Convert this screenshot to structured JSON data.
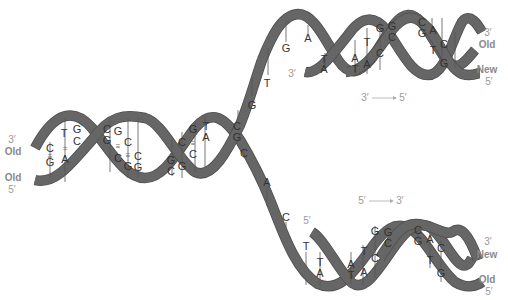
{
  "diagram": {
    "title_partial": "DNA replication fork",
    "colors": {
      "strand": "#666666",
      "label": "#9a9a9a",
      "base_text": "#333333"
    },
    "parent_helix": {
      "left_labels": {
        "top_end": "3′",
        "top_strand": "Old",
        "bottom_strand": "Old",
        "bottom_end": "5′"
      },
      "base_pairs": [
        {
          "top": "C",
          "bottom": "G",
          "bonds": "≡"
        },
        {
          "top": "T",
          "bottom": "A",
          "bonds": "="
        },
        {
          "top": "G",
          "bottom": "C",
          "bonds": "≡"
        },
        {
          "top": "C",
          "bottom": "G",
          "bonds": "≡"
        },
        {
          "top": "G",
          "bottom": "C",
          "bonds": "≡"
        },
        {
          "top": "C",
          "bottom": "G",
          "bonds": "≡"
        },
        {
          "top": "C",
          "bottom": "G",
          "bonds": "≡"
        },
        {
          "top": "G",
          "bottom": "C",
          "bonds": "≡"
        },
        {
          "top": "C",
          "bottom": "G",
          "bonds": "≡"
        },
        {
          "top": "G",
          "bottom": "C",
          "bonds": "≡"
        },
        {
          "top": "T",
          "bottom": "A",
          "bonds": "="
        }
      ]
    },
    "fork_single_strand_bases_top": [
      "C",
      "G",
      "G",
      "T",
      "G",
      "A"
    ],
    "fork_single_strand_bases_bottom": [
      "C",
      "A",
      "C",
      "T"
    ],
    "upper_daughter": {
      "new_strand_start_label": "3′",
      "direction_label": {
        "from": "3′",
        "to": "5′"
      },
      "right_labels": {
        "top_end": "3′",
        "top_strand": "Old",
        "bottom_strand": "New",
        "bottom_end": "5′"
      },
      "base_pairs": [
        {
          "top": "T",
          "bottom": "A"
        },
        {
          "top": "A",
          "bottom": "T"
        },
        {
          "top": "T",
          "bottom": "A"
        },
        {
          "top": "G",
          "bottom": "C"
        },
        {
          "top": "G",
          "bottom": "C"
        },
        {
          "top": "C",
          "bottom": "G"
        },
        {
          "top": "A",
          "bottom": "T"
        },
        {
          "top": "C",
          "bottom": "G"
        }
      ]
    },
    "lower_daughter": {
      "new_strand_start_label": "5′",
      "direction_label": {
        "from": "5′",
        "to": "3′"
      },
      "right_labels": {
        "top_end": "3′",
        "top_strand": "New",
        "bottom_strand": "Old",
        "bottom_end": "5′"
      },
      "base_pairs": [
        {
          "top": "T",
          "bottom": "A"
        },
        {
          "top": "A",
          "bottom": "T"
        },
        {
          "top": "T",
          "bottom": "A"
        },
        {
          "top": "G",
          "bottom": "C"
        },
        {
          "top": "G",
          "bottom": "C"
        },
        {
          "top": "C",
          "bottom": "G"
        },
        {
          "top": "A",
          "bottom": "T"
        },
        {
          "top": "C",
          "bottom": "G"
        }
      ]
    }
  }
}
